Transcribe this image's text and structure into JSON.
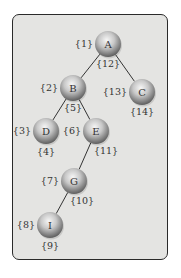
{
  "diagram": {
    "type": "tree",
    "nodes": [
      {
        "id": "A",
        "label": "A",
        "x": 108,
        "y": 44,
        "pre": "{1}",
        "post": "{12}"
      },
      {
        "id": "B",
        "label": "B",
        "x": 73,
        "y": 88,
        "pre": "{2}",
        "post": "{5}"
      },
      {
        "id": "C",
        "label": "C",
        "x": 142,
        "y": 92,
        "pre": "{13}",
        "post": "{14}"
      },
      {
        "id": "D",
        "label": "D",
        "x": 46,
        "y": 131,
        "pre": "{3}",
        "post": "{4}"
      },
      {
        "id": "E",
        "label": "E",
        "x": 96,
        "y": 131,
        "pre": "{6}",
        "post": "{11}"
      },
      {
        "id": "G",
        "label": "G",
        "x": 74,
        "y": 181,
        "pre": "{7}",
        "post": "{10}"
      },
      {
        "id": "I",
        "label": "I",
        "x": 50,
        "y": 225,
        "pre": "{8}",
        "post": "{9}"
      }
    ],
    "edges": [
      [
        "A",
        "B"
      ],
      [
        "A",
        "C"
      ],
      [
        "B",
        "D"
      ],
      [
        "B",
        "E"
      ],
      [
        "E",
        "G"
      ],
      [
        "G",
        "I"
      ]
    ],
    "colors": {
      "background": "#e4e4e2",
      "border": "#2a2a2a",
      "edge": "#333333",
      "sphere_light": "#f4f4f4",
      "sphere_dark": "#6a6a6a"
    }
  }
}
